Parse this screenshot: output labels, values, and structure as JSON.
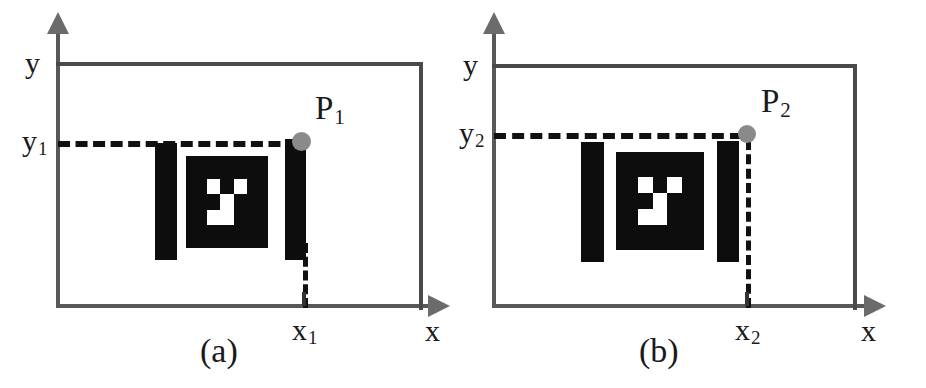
{
  "figure": {
    "type": "diagram",
    "background_color": "#ffffff",
    "ink_color": "#111111",
    "axis_color": "#585858",
    "dot_color": "#8a8a8a"
  },
  "panels": [
    {
      "id": "a",
      "caption": "(a)",
      "y_axis_label": "y",
      "x_axis_label": "x",
      "y_tick_label": "y",
      "y_tick_sub": "1",
      "x_tick_label": "x",
      "x_tick_sub": "1",
      "point_label": "P",
      "point_sub": "1",
      "marker_pattern": [
        [
          0,
          0,
          0,
          0,
          0
        ],
        [
          0,
          1,
          0,
          1,
          0
        ],
        [
          0,
          0,
          1,
          0,
          0
        ],
        [
          0,
          1,
          1,
          0,
          0
        ],
        [
          0,
          0,
          0,
          0,
          0
        ]
      ]
    },
    {
      "id": "b",
      "caption": "(b)",
      "y_axis_label": "y",
      "x_axis_label": "x",
      "y_tick_label": "y",
      "y_tick_sub": "2",
      "x_tick_label": "x",
      "x_tick_sub": "2",
      "point_label": "P",
      "point_sub": "2",
      "marker_pattern": [
        [
          0,
          0,
          0,
          0,
          0
        ],
        [
          0,
          1,
          0,
          1,
          0
        ],
        [
          0,
          0,
          1,
          0,
          0
        ],
        [
          0,
          1,
          1,
          0,
          0
        ],
        [
          0,
          0,
          0,
          0,
          0
        ]
      ]
    }
  ]
}
